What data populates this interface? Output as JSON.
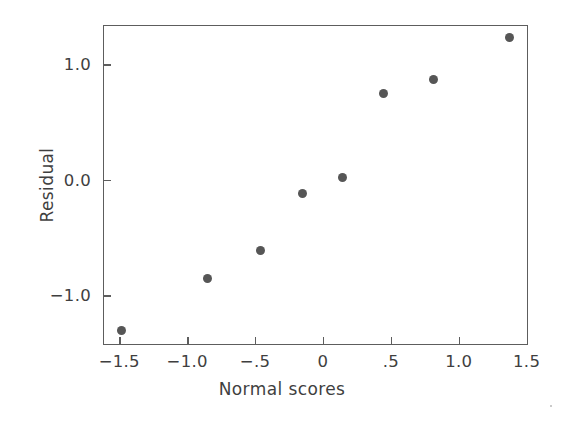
{
  "chart_data": {
    "type": "scatter",
    "title": "",
    "xlabel": "Normal scores",
    "ylabel": "Residual",
    "xlim": [
      -1.62,
      1.51
    ],
    "ylim": [
      -1.43,
      1.34
    ],
    "grid": false,
    "legend": null,
    "marker_color": "#565656",
    "frame_color": "#5d5d5d",
    "xticks": [
      -1.5,
      -1.0,
      -0.5,
      0,
      0.5,
      1.0,
      1.5
    ],
    "xticklabels": [
      "−1.5",
      "−1.0",
      "−.5",
      "0",
      ".5",
      "1.0",
      "1.5"
    ],
    "yticks": [
      1.0,
      0.0,
      -1.0
    ],
    "yticklabels": [
      "1.0",
      "0.0",
      "−1.0"
    ],
    "points": [
      {
        "x": -1.49,
        "y": -1.3
      },
      {
        "x": -0.86,
        "y": -0.85
      },
      {
        "x": -0.47,
        "y": -0.6
      },
      {
        "x": -0.16,
        "y": -0.11
      },
      {
        "x": 0.14,
        "y": 0.03
      },
      {
        "x": 0.44,
        "y": 0.76
      },
      {
        "x": 0.81,
        "y": 0.88
      },
      {
        "x": 1.37,
        "y": 1.24
      }
    ]
  }
}
